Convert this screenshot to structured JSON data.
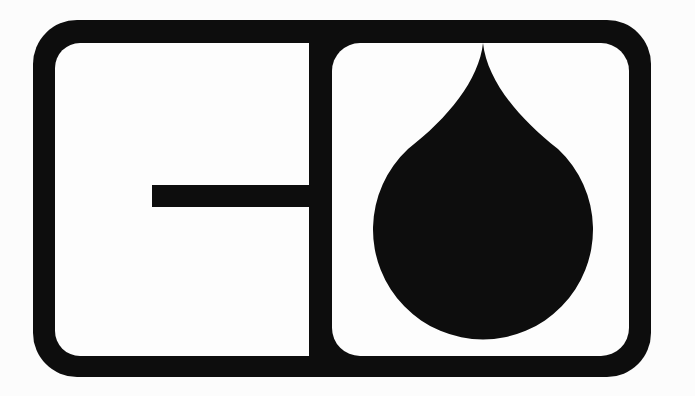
{
  "page": {
    "background": "#fcfcfc"
  },
  "colors": {
    "ink": "#0d0d0d",
    "paper": "#fdfdfd"
  },
  "logo": {
    "alt": "Monochrome badge logo: a thick black rounded rectangle divided by a vertical bar into two panels; the left panel contains a horizontal crossbar forming a G-like glyph, the right panel contains a solid black teardrop (drop) symbol whose tip touches the top border"
  }
}
